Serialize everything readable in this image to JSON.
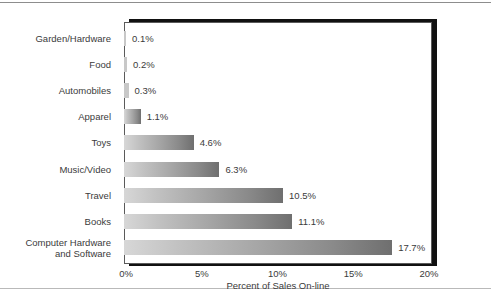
{
  "chart_data": {
    "type": "bar",
    "orientation": "horizontal",
    "title": "",
    "xlabel": "Percent of Sales On-line",
    "ylabel": "",
    "xlim": [
      0,
      20
    ],
    "xticks": [
      "0%",
      "5%",
      "10%",
      "15%",
      "20%"
    ],
    "xtick_values": [
      0,
      5,
      10,
      15,
      20
    ],
    "grid": false,
    "legend": false,
    "categories": [
      "Garden/Hardware",
      "Food",
      "Automobiles",
      "Apparel",
      "Toys",
      "Music/Video",
      "Travel",
      "Books",
      "Computer Hardware\nand Software"
    ],
    "values": [
      0.1,
      0.2,
      0.3,
      1.1,
      4.6,
      6.3,
      10.5,
      11.1,
      17.7
    ],
    "data_labels": [
      "0.1%",
      "0.2%",
      "0.3%",
      "1.1%",
      "4.6%",
      "6.3%",
      "10.5%",
      "11.1%",
      "17.7%"
    ]
  },
  "colors": {
    "bar_light": "#d7d7d7",
    "bar_dark": "#6f6f6f",
    "frame": "#5a5a5a",
    "shadow": "#111111",
    "text": "#3b3b3b"
  }
}
